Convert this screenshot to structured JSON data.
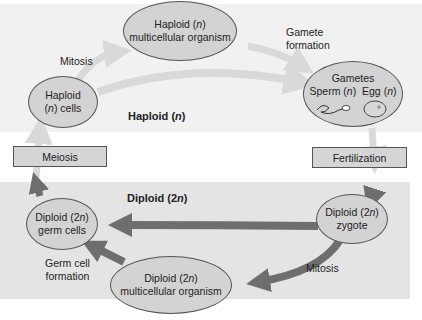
{
  "regions": {
    "haploid": {
      "label": "Haploid (n)",
      "prefix": "Haploid (",
      "n": "n",
      "suffix": ")"
    },
    "diploid": {
      "label": "Diploid (2n)",
      "prefix": "Diploid (2",
      "n": "n",
      "suffix": ")"
    }
  },
  "nodes": {
    "haploid_organism": {
      "line1_prefix": "Haploid (",
      "line1_n": "n",
      "line1_suffix": ")",
      "line2": "multicellular organism"
    },
    "haploid_cells": {
      "line1": "Haploid",
      "line2_prefix": "(",
      "line2_n": "n",
      "line2_suffix": ") cells"
    },
    "gametes": {
      "title": "Gametes",
      "sperm_prefix": "Sperm (",
      "sperm_n": "n",
      "sperm_suffix": ")",
      "egg_prefix": "Egg (",
      "egg_n": "n",
      "egg_suffix": ")"
    },
    "diploid_germ_cells": {
      "line1_prefix": "Diploid (2",
      "line1_n": "n",
      "line1_suffix": ")",
      "line2": "germ cells"
    },
    "diploid_zygote": {
      "line1_prefix": "Diploid (2",
      "line1_n": "n",
      "line1_suffix": ")",
      "line2": "zygote"
    },
    "diploid_organism": {
      "line1_prefix": "Diploid (2",
      "line1_n": "n",
      "line1_suffix": ")",
      "line2": "multicellular organism"
    }
  },
  "boxes": {
    "meiosis": "Meiosis",
    "fertilization": "Fertilization"
  },
  "arrow_labels": {
    "mitosis_top": "Mitosis",
    "gamete_formation_1": "Gamete",
    "gamete_formation_2": "formation",
    "germ_cell_formation_1": "Germ cell",
    "germ_cell_formation_2": "formation",
    "mitosis_bottom": "Mitosis"
  },
  "colors": {
    "haploid_bg": "#f1f1f1",
    "diploid_bg": "#e4e4e4",
    "node_fill": "#d3d3d3",
    "haploid_arrow": "#d9d9d9",
    "diploid_arrow": "#6e6e6e"
  }
}
